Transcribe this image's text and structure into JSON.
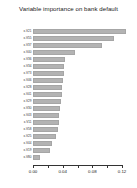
{
  "chart_data": {
    "type": "bar",
    "orientation": "horizontal",
    "title": "Variable importance on bank default",
    "xlabel": "",
    "ylabel": "",
    "xlim": [
      0.0,
      0.1346
    ],
    "xticks": [
      0.0,
      0.02,
      0.04,
      0.06,
      0.08,
      0.1,
      0.12
    ],
    "xticklabels": [
      "0.00",
      "",
      "0.04",
      "",
      "0.08",
      "",
      "0.12"
    ],
    "grid": false,
    "legend": null,
    "bar_color": "#b3b3b3",
    "bar_edge_color": "#a6a6a6",
    "background_color": "#ffffff",
    "text_color": "#1a1a1a",
    "categories": [
      "x.V21",
      "x.V55",
      "x.V37",
      "x.V40",
      "x.V36",
      "x.V34",
      "x.V73",
      "x.V46",
      "x.V28",
      "x.V41",
      "x.V29",
      "x.V30",
      "x.V43",
      "x.V11",
      "x.V58",
      "x.V25",
      "x.V44",
      "x.V19",
      "x.V80"
    ],
    "values": [
      0.1259,
      0.1096,
      0.0932,
      0.056,
      0.0437,
      0.0417,
      0.0414,
      0.0399,
      0.0391,
      0.0387,
      0.0374,
      0.0362,
      0.0356,
      0.0345,
      0.0332,
      0.0315,
      0.0252,
      0.0228,
      0.0098
    ]
  }
}
